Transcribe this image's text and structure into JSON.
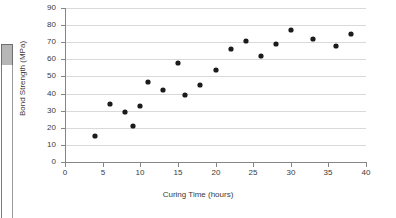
{
  "chart_data": {
    "type": "scatter",
    "title": "",
    "xlabel": "Curing Time (hours)",
    "ylabel": "Bond Strength (MPa)",
    "xlim": [
      0,
      40
    ],
    "ylim": [
      0,
      90
    ],
    "xticks": [
      0,
      5,
      10,
      15,
      20,
      25,
      30,
      35,
      40
    ],
    "yticks": [
      0,
      10,
      20,
      30,
      40,
      50,
      60,
      70,
      80,
      90
    ],
    "grid": "horizontal",
    "legend": "none",
    "marker": "filled-diamond",
    "marker_color": "#1c1c1c",
    "points": [
      {
        "x": 4,
        "y": 15
      },
      {
        "x": 6,
        "y": 34
      },
      {
        "x": 8,
        "y": 29
      },
      {
        "x": 9,
        "y": 21
      },
      {
        "x": 10,
        "y": 33
      },
      {
        "x": 11,
        "y": 47
      },
      {
        "x": 13,
        "y": 42
      },
      {
        "x": 15,
        "y": 58
      },
      {
        "x": 16,
        "y": 39
      },
      {
        "x": 18,
        "y": 45
      },
      {
        "x": 20,
        "y": 54
      },
      {
        "x": 22,
        "y": 66
      },
      {
        "x": 24,
        "y": 71
      },
      {
        "x": 26,
        "y": 62
      },
      {
        "x": 28,
        "y": 69
      },
      {
        "x": 30,
        "y": 77
      },
      {
        "x": 33,
        "y": 72
      },
      {
        "x": 36,
        "y": 68
      },
      {
        "x": 38,
        "y": 75
      }
    ]
  },
  "left_fragment": {
    "scrollbar_thumb": "",
    "scrollbar_track": "",
    "tick_mark": ""
  }
}
